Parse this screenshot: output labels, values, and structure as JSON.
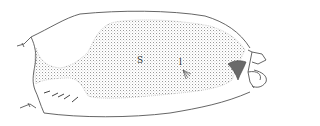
{
  "figure": {
    "labels": [
      {
        "id": "S",
        "text": "S",
        "x": 137,
        "y": 62
      },
      {
        "id": "l",
        "text": "l",
        "x": 179,
        "y": 64
      }
    ],
    "colors": {
      "line": "#555555",
      "stipple": "#9a9a9a",
      "background": "#ffffff"
    }
  }
}
